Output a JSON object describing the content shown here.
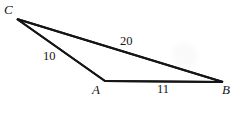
{
  "figure": {
    "type": "geometry-diagram",
    "shape": "triangle",
    "background_color": "#ffffff",
    "stroke_color": "#151515",
    "stroke_width": 2,
    "width": 238,
    "height": 113,
    "vertices": [
      {
        "id": "C",
        "label": "C",
        "x": 17,
        "y": 19
      },
      {
        "id": "A",
        "label": "A",
        "x": 105,
        "y": 81
      },
      {
        "id": "B",
        "label": "B",
        "x": 223,
        "y": 82
      }
    ],
    "sides": [
      {
        "id": "CA",
        "from": "C",
        "to": "A",
        "label": "10",
        "length": 10
      },
      {
        "id": "AB",
        "from": "A",
        "to": "B",
        "label": "11",
        "length": 11
      },
      {
        "id": "CB",
        "from": "C",
        "to": "B",
        "label": "20",
        "length": 20
      }
    ]
  },
  "chart_data": {
    "type": "diagram",
    "title": "",
    "categories": [
      "CA",
      "AB",
      "CB"
    ],
    "values": [
      10,
      11,
      20
    ],
    "annotations": [
      "C",
      "A",
      "B",
      "10",
      "11",
      "20"
    ]
  }
}
